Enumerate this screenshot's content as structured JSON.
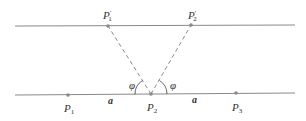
{
  "diagram": {
    "title": "",
    "colors": {
      "line": "#8a8a8a",
      "point": "#8a8a8a",
      "text": "#333333",
      "background": "#ffffff"
    },
    "lines": [
      {
        "id": "top-line",
        "x1": 15,
        "y1": 26,
        "x2": 295,
        "y2": 25
      },
      {
        "id": "bottom-line",
        "x1": 15,
        "y1": 95,
        "x2": 295,
        "y2": 93
      }
    ],
    "points": [
      {
        "id": "P1prime",
        "label": "P",
        "sub": "1",
        "prime": true,
        "x": 108,
        "y": 26,
        "lx": 103,
        "ly": 19
      },
      {
        "id": "P2prime",
        "label": "P",
        "sub": "2",
        "prime": true,
        "x": 191,
        "y": 25,
        "lx": 188,
        "ly": 19
      },
      {
        "id": "P1",
        "label": "P",
        "sub": "1",
        "prime": false,
        "x": 68,
        "y": 95,
        "lx": 64,
        "ly": 112
      },
      {
        "id": "P2",
        "label": "P",
        "sub": "2",
        "prime": false,
        "x": 151,
        "y": 94,
        "lx": 147,
        "ly": 111
      },
      {
        "id": "P3",
        "label": "P",
        "sub": "3",
        "prime": false,
        "x": 236,
        "y": 93,
        "lx": 232,
        "ly": 111
      }
    ],
    "dashed_segments": [
      {
        "from": "P2",
        "to": "P1prime"
      },
      {
        "from": "P2",
        "to": "P2prime"
      }
    ],
    "angles": [
      {
        "label": "φ",
        "x": 129,
        "y": 89
      },
      {
        "label": "φ",
        "x": 170,
        "y": 89
      }
    ],
    "distances": [
      {
        "label": "a",
        "x": 108,
        "y": 104
      },
      {
        "label": "a",
        "x": 192,
        "y": 103
      }
    ]
  }
}
